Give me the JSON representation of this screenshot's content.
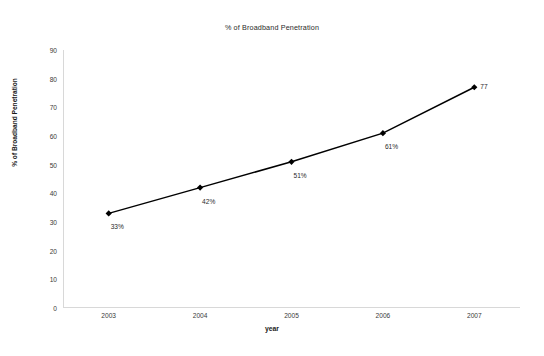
{
  "chart_data": {
    "type": "line",
    "title": "% of Broadband Penetration",
    "xlabel": "year",
    "ylabel": "% of Broadband Penetration",
    "categories": [
      "2003",
      "2004",
      "2005",
      "2006",
      "2007"
    ],
    "values": [
      33,
      42,
      51,
      61,
      77
    ],
    "point_labels": [
      "33%",
      "42%",
      "51%",
      "61%",
      "77"
    ],
    "ylim": [
      0,
      90
    ],
    "yticks": [
      0,
      10,
      20,
      30,
      40,
      50,
      60,
      70,
      80,
      90
    ],
    "ytick_labels": [
      "0",
      "10",
      "20",
      "30",
      "40",
      "50",
      "60",
      "70",
      "80",
      "90"
    ],
    "grid": false,
    "legend": "none",
    "series": [
      {
        "name": "% of Broadband Penetration",
        "values": [
          33,
          42,
          51,
          61,
          77
        ],
        "color": "#000000",
        "marker": "diamond"
      }
    ],
    "colors": {
      "line": "#000000",
      "marker": "#000000",
      "axis": "#d8d8d8",
      "text": "#2a2a2a",
      "background": "#ffffff"
    }
  }
}
